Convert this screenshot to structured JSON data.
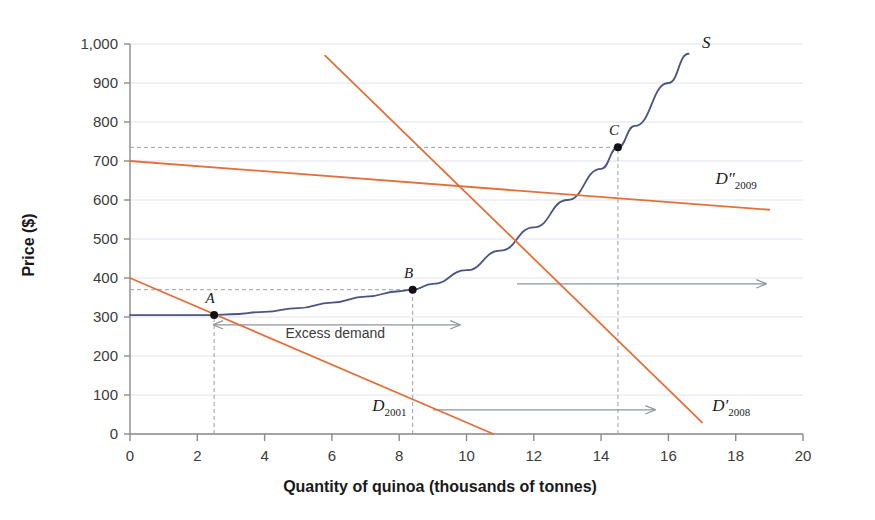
{
  "chart_data": {
    "type": "line",
    "title": "",
    "xlabel": "Quantity of quinoa (thousands of tonnes)",
    "ylabel": "Price ($)",
    "xlim": [
      0,
      20
    ],
    "ylim": [
      0,
      1000
    ],
    "xticks": [
      "0",
      "2",
      "4",
      "6",
      "8",
      "10",
      "12",
      "14",
      "16",
      "18",
      "20"
    ],
    "yticks": [
      "0",
      "100",
      "200",
      "300",
      "400",
      "500",
      "600",
      "700",
      "800",
      "900",
      "1,000"
    ],
    "grid": true,
    "legend_position": "inline-curve-labels",
    "colors": {
      "supply": "#4a5584",
      "demand": "#e2703a",
      "grid": "#dfe3ea",
      "axis": "#8a8a8a",
      "guide": "#9aa0a8",
      "arrow": "#8e949c",
      "point": "#111111"
    },
    "series": [
      {
        "name": "S",
        "label": "S",
        "sub": "",
        "type": "supply",
        "color": "#4a5584",
        "label_x": 17.0,
        "label_y": 990,
        "points": [
          [
            0.0,
            305
          ],
          [
            1.0,
            305
          ],
          [
            2.0,
            305
          ],
          [
            2.5,
            305
          ],
          [
            3.0,
            307
          ],
          [
            4.0,
            313
          ],
          [
            5.0,
            323
          ],
          [
            6.0,
            337
          ],
          [
            7.0,
            352
          ],
          [
            8.0,
            366
          ],
          [
            8.4,
            370
          ],
          [
            9.0,
            385
          ],
          [
            10.0,
            420
          ],
          [
            11.0,
            470
          ],
          [
            12.0,
            530
          ],
          [
            13.0,
            600
          ],
          [
            14.0,
            680
          ],
          [
            14.5,
            735
          ],
          [
            15.0,
            790
          ],
          [
            16.0,
            900
          ],
          [
            16.6,
            975
          ]
        ]
      },
      {
        "name": "D2001",
        "label": "D",
        "sub": "2001",
        "type": "demand",
        "color": "#e2703a",
        "label_x": 7.2,
        "label_y": 60,
        "points": [
          [
            0.0,
            400
          ],
          [
            10.8,
            0
          ]
        ]
      },
      {
        "name": "D'2008",
        "label": "D′",
        "sub": "2008",
        "type": "demand",
        "color": "#e2703a",
        "label_x": 17.3,
        "label_y": 60,
        "points": [
          [
            5.8,
            970
          ],
          [
            17.0,
            30
          ]
        ]
      },
      {
        "name": "D\"2009",
        "label": "D″",
        "sub": "2009",
        "type": "demand",
        "color": "#e2703a",
        "label_x": 17.4,
        "label_y": 640,
        "points": [
          [
            0.0,
            700
          ],
          [
            19.0,
            575
          ]
        ]
      }
    ],
    "equilibrium_points": [
      {
        "name": "A",
        "x": 2.5,
        "y": 305,
        "label_dx": -4,
        "label_dy": -12
      },
      {
        "name": "B",
        "x": 8.4,
        "y": 370,
        "label_dx": -4,
        "label_dy": -12
      },
      {
        "name": "C",
        "x": 14.5,
        "y": 735,
        "label_dx": -4,
        "label_dy": -12
      }
    ],
    "guides": [
      {
        "type": "vertical",
        "x": 2.5,
        "y_from": 0,
        "y_to": 305
      },
      {
        "type": "vertical",
        "x": 8.4,
        "y_from": 0,
        "y_to": 370
      },
      {
        "type": "vertical",
        "x": 14.5,
        "y_from": 0,
        "y_to": 735
      },
      {
        "type": "horizontal",
        "y": 370,
        "x_from": 0,
        "x_to": 8.4
      },
      {
        "type": "horizontal",
        "y": 735,
        "x_from": 0,
        "x_to": 14.5
      }
    ],
    "annotations": [
      {
        "name": "excess-demand",
        "text": "Excess demand",
        "arrow": "double",
        "x_from": 2.5,
        "x_to": 9.8,
        "y": 280,
        "text_x": 6.1,
        "text_y": 245
      },
      {
        "name": "demand-shift-upper",
        "text": "",
        "arrow": "right",
        "x_from": 11.5,
        "x_to": 18.9,
        "y": 385,
        "text_x": 0,
        "text_y": 0
      },
      {
        "name": "demand-shift-lower",
        "text": "",
        "arrow": "right",
        "x_from": 9.0,
        "x_to": 15.6,
        "y": 62,
        "text_x": 0,
        "text_y": 0
      }
    ]
  }
}
